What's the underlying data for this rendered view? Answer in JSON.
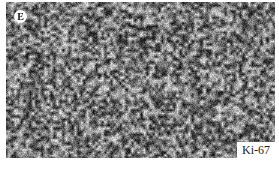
{
  "figure": {
    "panel_label": "E",
    "stain_label": "Ki-67",
    "colors": {
      "background": "#ffffff",
      "texture_dark": "#1a1a1a",
      "texture_light": "#e6e6e6"
    }
  }
}
